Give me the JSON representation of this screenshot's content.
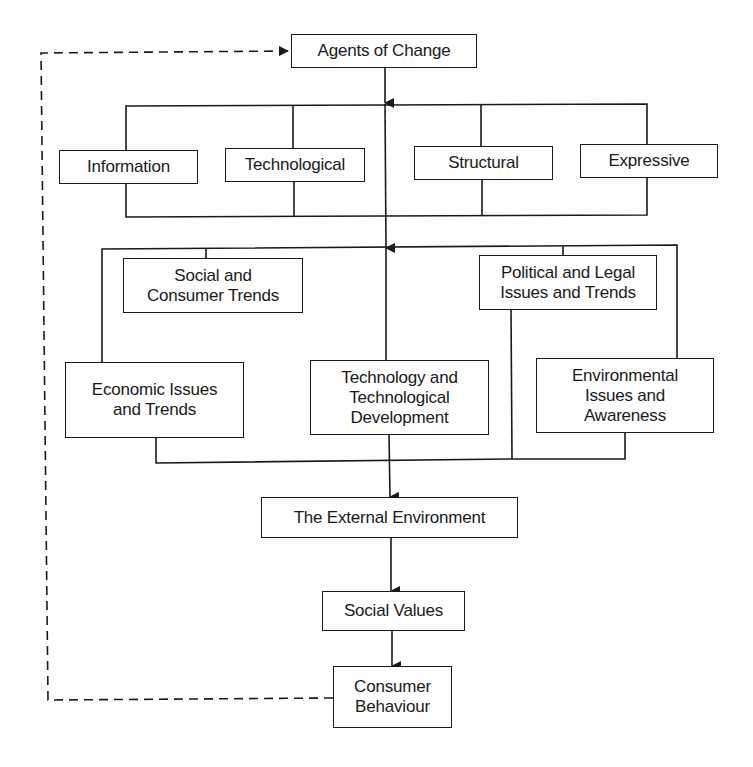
{
  "diagram": {
    "colors": {
      "line": "#1a1a1a",
      "background": "#ffffff"
    },
    "nodes": {
      "agents_of_change": "Agents of Change",
      "information": "Information",
      "technological": "Technological",
      "structural": "Structural",
      "expressive": "Expressive",
      "social_consumer_trends": "Social and\nConsumer Trends",
      "political_legal": "Political and Legal\nIssues and Trends",
      "economic": "Economic Issues\nand Trends",
      "technology_development": "Technology and\nTechnological\nDevelopment",
      "environmental": "Environmental\nIssues and\nAwareness",
      "external_environment": "The External Environment",
      "social_values": "Social Values",
      "consumer_behaviour": "Consumer\nBehaviour"
    },
    "edges": [
      {
        "from": "agents_of_change",
        "to": "agent_types_group",
        "style": "solid"
      },
      {
        "from": "agent_types_group",
        "to": "environment_factors_group",
        "style": "solid"
      },
      {
        "from": "environment_factors_group",
        "to": "external_environment",
        "style": "solid"
      },
      {
        "from": "external_environment",
        "to": "social_values",
        "style": "solid"
      },
      {
        "from": "social_values",
        "to": "consumer_behaviour",
        "style": "solid"
      },
      {
        "from": "consumer_behaviour",
        "to": "agents_of_change",
        "style": "dashed"
      }
    ]
  }
}
